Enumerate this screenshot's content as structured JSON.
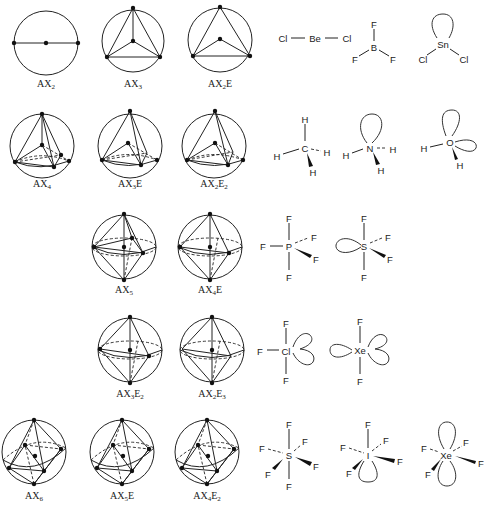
{
  "figure": {
    "rows": [
      {
        "electron_pairs": 2,
        "geometries": [
          {
            "label_base": "AX",
            "sub1": "2",
            "suffix": "",
            "sub2": ""
          }
        ],
        "molecules": [
          {
            "name": "BeCl2",
            "central": "Be",
            "ligands": [
              "Cl",
              "Cl"
            ]
          }
        ]
      },
      {
        "electron_pairs": 3,
        "geometries": [
          {
            "label_base": "AX",
            "sub1": "3",
            "suffix": "",
            "sub2": ""
          },
          {
            "label_base": "AX",
            "sub1": "2",
            "suffix": "E",
            "sub2": ""
          }
        ],
        "molecules": [
          {
            "name": "BF3",
            "central": "B",
            "ligands": [
              "F",
              "F",
              "F"
            ]
          },
          {
            "name": "SnCl2",
            "central": "Sn",
            "ligands": [
              "Cl",
              "Cl"
            ]
          }
        ]
      },
      {
        "electron_pairs": 4,
        "geometries": [
          {
            "label_base": "AX",
            "sub1": "4",
            "suffix": "",
            "sub2": ""
          },
          {
            "label_base": "AX",
            "sub1": "3",
            "suffix": "E",
            "sub2": ""
          },
          {
            "label_base": "AX",
            "sub1": "2",
            "suffix": "E",
            "sub2": "2"
          }
        ],
        "molecules": [
          {
            "name": "CH4",
            "central": "C",
            "ligands": [
              "H",
              "H",
              "H",
              "H"
            ]
          },
          {
            "name": "NH3",
            "central": "N",
            "ligands": [
              "H",
              "H",
              "H"
            ]
          },
          {
            "name": "H2O",
            "central": "O",
            "ligands": [
              "H",
              "H"
            ]
          }
        ]
      },
      {
        "electron_pairs": 5,
        "geometries": [
          {
            "label_base": "AX",
            "sub1": "5",
            "suffix": "",
            "sub2": ""
          },
          {
            "label_base": "AX",
            "sub1": "4",
            "suffix": "E",
            "sub2": ""
          },
          {
            "label_base": "AX",
            "sub1": "3",
            "suffix": "E",
            "sub2": "2"
          },
          {
            "label_base": "AX",
            "sub1": "2",
            "suffix": "E",
            "sub2": "3"
          }
        ],
        "molecules": [
          {
            "name": "PF5",
            "central": "P",
            "ligands": [
              "F",
              "F",
              "F",
              "F",
              "F"
            ]
          },
          {
            "name": "SF4",
            "central": "S",
            "ligands": [
              "F",
              "F",
              "F",
              "F"
            ]
          },
          {
            "name": "ClF3",
            "central": "Cl",
            "ligands": [
              "F",
              "F",
              "F"
            ]
          },
          {
            "name": "XeF2",
            "central": "Xe",
            "ligands": [
              "F",
              "F"
            ]
          }
        ]
      },
      {
        "electron_pairs": 6,
        "geometries": [
          {
            "label_base": "AX",
            "sub1": "6",
            "suffix": "",
            "sub2": ""
          },
          {
            "label_base": "AX",
            "sub1": "5",
            "suffix": "E",
            "sub2": ""
          },
          {
            "label_base": "AX",
            "sub1": "4",
            "suffix": "E",
            "sub2": "2"
          }
        ],
        "molecules": [
          {
            "name": "SF6",
            "central": "S",
            "ligands": [
              "F",
              "F",
              "F",
              "F",
              "F",
              "F"
            ]
          },
          {
            "name": "IF5",
            "central": "I",
            "ligands": [
              "F",
              "F",
              "F",
              "F",
              "F"
            ]
          },
          {
            "name": "XeF4",
            "central": "Xe",
            "ligands": [
              "F",
              "F",
              "F",
              "F"
            ]
          }
        ]
      }
    ]
  }
}
